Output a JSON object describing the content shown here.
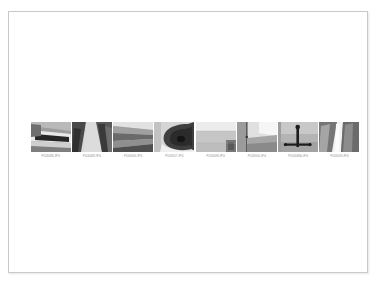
{
  "document": {
    "page_background": "#ffffff",
    "canvas_background": "#ffffff",
    "border_color": "#c9c9c9"
  },
  "contact_sheet": {
    "caption_color": "#8d8d8d",
    "thumbnails": [
      {
        "filename": "P1030486.JPG",
        "alt": "grayscale photo of angular modern building facade with dark recessed window band",
        "scene": "facade-dark-band"
      },
      {
        "filename": "P1030488.JPG",
        "alt": "grayscale photo of dark ribbed canopy underside converging to a point",
        "scene": "ribbed-canopy"
      },
      {
        "filename": "P1030490.JPG",
        "alt": "grayscale photo of a long diagonal beam receding in perspective",
        "scene": "diagonal-beam"
      },
      {
        "filename": "P1030517.JPG",
        "alt": "grayscale photo of a curved dark sculptural form against pale background",
        "scene": "curved-form"
      },
      {
        "filename": "P1030498.JPG",
        "alt": "grayscale photo of a flat pale textured wall panel surface",
        "scene": "pale-panel"
      },
      {
        "filename": "P1030500.JPG",
        "alt": "grayscale photo of a bright corner with vertical post and bright sky",
        "scene": "corner-post"
      },
      {
        "filename": "P1030486b.JPG",
        "alt": "grayscale photo of a dark T-shaped mast or pole against gray sky",
        "scene": "t-mast"
      },
      {
        "filename": "P1030509.JPG",
        "alt": "grayscale photo of tall slabs converging with bright light shaft between",
        "scene": "light-shaft"
      }
    ]
  }
}
